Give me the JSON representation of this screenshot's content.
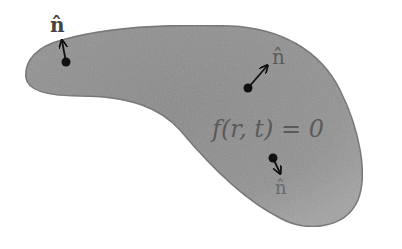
{
  "diagram": {
    "type": "level-set surface with normal vectors",
    "equation_label": "f(r, t) = 0",
    "colors": {
      "region_fill": "#8c8c8c",
      "region_fill_light": "#a6a6a6",
      "region_stroke": "#6e6e6e",
      "arrow": "#111111",
      "point": "#111111",
      "label_text": "#555555",
      "top_left_label": "#444444"
    },
    "normals": [
      {
        "label": "n̂",
        "position": "top-left",
        "point": [
          66,
          62
        ],
        "tip": [
          62,
          42
        ]
      },
      {
        "label": "n̂",
        "position": "upper-right",
        "point": [
          248,
          88
        ],
        "tip": [
          268,
          66
        ]
      },
      {
        "label": "n̂",
        "position": "lower-right",
        "point": [
          273,
          158
        ],
        "tip": [
          281,
          174
        ]
      }
    ]
  }
}
